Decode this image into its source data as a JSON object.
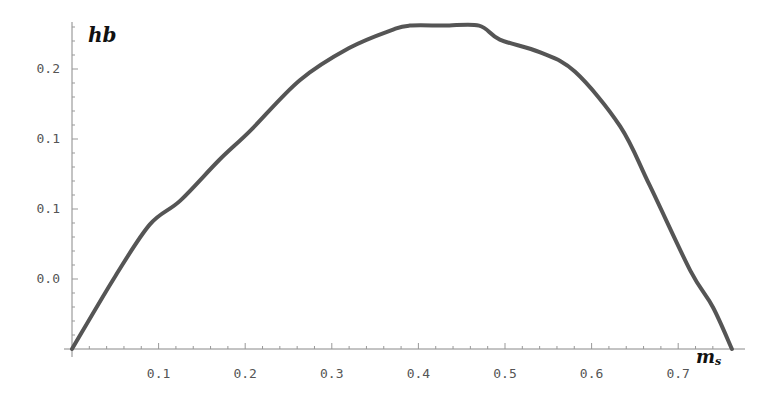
{
  "chart_data": {
    "type": "line",
    "title": "",
    "xlabel": "m_s",
    "ylabel": "hb",
    "xlim": [
      0,
      0.79
    ],
    "ylim": [
      0,
      0.233
    ],
    "grid": false,
    "legend": null,
    "x_ticks": [
      {
        "value": 0.1,
        "label": "0.1"
      },
      {
        "value": 0.2,
        "label": "0.2"
      },
      {
        "value": 0.3,
        "label": "0.3"
      },
      {
        "value": 0.4,
        "label": "0.4"
      },
      {
        "value": 0.5,
        "label": "0.5"
      },
      {
        "value": 0.6,
        "label": "0.6"
      },
      {
        "value": 0.7,
        "label": "0.7"
      }
    ],
    "y_ticks": [
      {
        "value": 0.05,
        "label": "0.0"
      },
      {
        "value": 0.1,
        "label": "0.1"
      },
      {
        "value": 0.15,
        "label": "0.1"
      },
      {
        "value": 0.2,
        "label": "0.2"
      }
    ],
    "series": [
      {
        "name": "hb",
        "color": "#555555",
        "x": [
          0,
          0.05,
          0.09,
          0.125,
          0.17,
          0.206,
          0.263,
          0.32,
          0.37,
          0.39,
          0.43,
          0.47,
          0.494,
          0.54,
          0.581,
          0.633,
          0.667,
          0.714,
          0.74,
          0.762
        ],
        "y": [
          0,
          0.052,
          0.089,
          0.106,
          0.135,
          0.156,
          0.192,
          0.215,
          0.228,
          0.231,
          0.231,
          0.231,
          0.221,
          0.212,
          0.198,
          0.159,
          0.117,
          0.056,
          0.03,
          0
        ]
      }
    ],
    "note": "Curve appears clipped flat at the top of the plot range between roughly x=0.39 and x=0.47."
  },
  "labels": {
    "y_axis_title": "hb",
    "x_axis_title_main": "m",
    "x_axis_title_sub": "s"
  }
}
